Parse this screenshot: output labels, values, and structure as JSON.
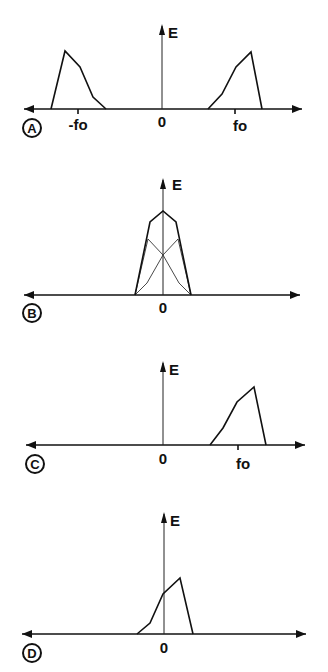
{
  "figure": {
    "panels": [
      {
        "id": "A",
        "label": "A",
        "y_axis_label": "E",
        "origin_label": "0",
        "tick_labels": {
          "neg": "-fo",
          "pos": "fo"
        },
        "description": "Double-sideband spectrum: mirrored bands centered at -fo and +fo"
      },
      {
        "id": "B",
        "label": "B",
        "y_axis_label": "E",
        "origin_label": "0",
        "description": "Both bands shifted to baseband and overlapping; thick envelope is the sum, thin lines are the individual components"
      },
      {
        "id": "C",
        "label": "C",
        "y_axis_label": "E",
        "origin_label": "0",
        "tick_labels": {
          "pos": "fo"
        },
        "description": "Single-sideband spectrum centered at fo"
      },
      {
        "id": "D",
        "label": "D",
        "y_axis_label": "E",
        "origin_label": "0",
        "description": "Single band shifted to baseband around 0"
      }
    ]
  }
}
